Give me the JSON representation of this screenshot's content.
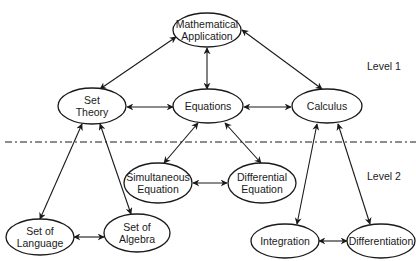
{
  "diagram": {
    "levels": [
      {
        "label": "Level 1",
        "x": 367,
        "y": 70
      },
      {
        "label": "Level 2",
        "x": 367,
        "y": 180
      }
    ],
    "divider": {
      "y": 142,
      "x1": 5,
      "x2": 416,
      "style": "dash-dot"
    },
    "nodes": [
      {
        "id": "math_app",
        "lines": [
          "Mathematical",
          "Application"
        ],
        "cx": 207,
        "cy": 30,
        "rx": 34,
        "ry": 17,
        "level": 1
      },
      {
        "id": "set_theory",
        "lines": [
          "Set",
          "Theory"
        ],
        "cx": 92,
        "cy": 106,
        "rx": 34,
        "ry": 18,
        "level": 1
      },
      {
        "id": "equations",
        "lines": [
          "Equations"
        ],
        "cx": 208,
        "cy": 106,
        "rx": 35,
        "ry": 17,
        "level": 1
      },
      {
        "id": "calculus",
        "lines": [
          "Calculus"
        ],
        "cx": 327,
        "cy": 106,
        "rx": 35,
        "ry": 17,
        "level": 1
      },
      {
        "id": "simultaneous",
        "lines": [
          "Simultaneous",
          "Equation"
        ],
        "cx": 158,
        "cy": 183,
        "rx": 34,
        "ry": 20,
        "level": 2
      },
      {
        "id": "differential_eq",
        "lines": [
          "Differential",
          "Equation"
        ],
        "cx": 262,
        "cy": 183,
        "rx": 34,
        "ry": 20,
        "level": 2
      },
      {
        "id": "set_language",
        "lines": [
          "Set of",
          "Language"
        ],
        "cx": 40,
        "cy": 237,
        "rx": 34,
        "ry": 18,
        "level": 2
      },
      {
        "id": "set_algebra",
        "lines": [
          "Set of",
          "Algebra"
        ],
        "cx": 137,
        "cy": 233,
        "rx": 33,
        "ry": 19,
        "level": 2
      },
      {
        "id": "integration",
        "lines": [
          "Integration"
        ],
        "cx": 285,
        "cy": 241,
        "rx": 34,
        "ry": 17,
        "level": 2
      },
      {
        "id": "differentiation",
        "lines": [
          "Differentiation"
        ],
        "cx": 381,
        "cy": 241,
        "rx": 34,
        "ry": 17,
        "level": 2
      }
    ],
    "edges": [
      {
        "from": "set_theory",
        "to": "math_app",
        "bidirectional": true,
        "x1": 100,
        "y1": 89,
        "x2": 176,
        "y2": 37
      },
      {
        "from": "math_app",
        "to": "equations",
        "bidirectional": true,
        "x1": 207,
        "y1": 48,
        "x2": 207,
        "y2": 89
      },
      {
        "from": "calculus",
        "to": "math_app",
        "bidirectional": true,
        "x1": 322,
        "y1": 89,
        "x2": 242,
        "y2": 30
      },
      {
        "from": "set_theory",
        "to": "equations",
        "bidirectional": true,
        "x1": 127,
        "y1": 107,
        "x2": 173,
        "y2": 107
      },
      {
        "from": "equations",
        "to": "calculus",
        "bidirectional": true,
        "x1": 244,
        "y1": 107,
        "x2": 291,
        "y2": 107
      },
      {
        "from": "equations",
        "to": "simultaneous",
        "bidirectional": true,
        "x1": 198,
        "y1": 123,
        "x2": 164,
        "y2": 163
      },
      {
        "from": "equations",
        "to": "differential_eq",
        "bidirectional": true,
        "x1": 225,
        "y1": 123,
        "x2": 261,
        "y2": 163
      },
      {
        "from": "simultaneous",
        "to": "differential_eq",
        "bidirectional": true,
        "x1": 193,
        "y1": 183,
        "x2": 227,
        "y2": 183
      },
      {
        "from": "set_theory",
        "to": "set_language",
        "bidirectional": true,
        "x1": 82,
        "y1": 124,
        "x2": 40,
        "y2": 219
      },
      {
        "from": "set_theory",
        "to": "set_algebra",
        "bidirectional": true,
        "x1": 100,
        "y1": 124,
        "x2": 131,
        "y2": 214
      },
      {
        "from": "set_language",
        "to": "set_algebra",
        "bidirectional": true,
        "x1": 74,
        "y1": 237,
        "x2": 104,
        "y2": 237
      },
      {
        "from": "calculus",
        "to": "integration",
        "bidirectional": true,
        "x1": 317,
        "y1": 124,
        "x2": 297,
        "y2": 224
      },
      {
        "from": "calculus",
        "to": "differentiation",
        "bidirectional": true,
        "x1": 338,
        "y1": 124,
        "x2": 370,
        "y2": 224
      },
      {
        "from": "integration",
        "to": "differentiation",
        "bidirectional": true,
        "x1": 319,
        "y1": 241,
        "x2": 347,
        "y2": 241
      }
    ]
  }
}
